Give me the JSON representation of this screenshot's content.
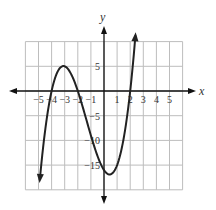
{
  "chart_data": {
    "type": "line",
    "title": "",
    "xlabel": "x",
    "ylabel": "y",
    "function": "f(x) = (x+4)(x+2)(x-2)",
    "x_ticks": [
      -5,
      -4,
      -3,
      -2,
      -1,
      1,
      2,
      3,
      4,
      5
    ],
    "y_ticks": [
      5,
      -5,
      -10,
      -15
    ],
    "x_tick_labels": [
      "−5",
      "−4",
      "−3",
      "−2",
      "−1",
      "1",
      "2",
      "3",
      "4",
      "5"
    ],
    "y_tick_labels": [
      "5",
      "−5",
      "−10",
      "−15"
    ],
    "xlim": [
      -6,
      6
    ],
    "ylim": [
      -20,
      10
    ],
    "grid": true,
    "grid_x_step": 1,
    "grid_y_step": 5,
    "roots": [
      -4,
      -2,
      2
    ],
    "local_max": {
      "x": -3.1,
      "y": 5.0
    },
    "local_min": {
      "x": 0.43,
      "y": -16.9
    },
    "y_intercept": -16,
    "x_range_plotted": [
      -4.9,
      2.4
    ],
    "series": [
      {
        "name": "f(x)",
        "x": [
          -4.9,
          -4.5,
          -4,
          -3.5,
          -3,
          -2.5,
          -2,
          -1.5,
          -1,
          -0.5,
          0,
          0.5,
          1,
          1.5,
          2,
          2.4
        ],
        "y": [
          -18.0,
          -7.9,
          0,
          3.9,
          5.0,
          3.9,
          0,
          -5.1,
          -9.0,
          -14.6,
          -16.0,
          -16.9,
          -15.0,
          -10.9,
          0,
          9.2
        ]
      }
    ],
    "legend": []
  },
  "labels": {
    "x_axis": "x",
    "y_axis": "y"
  },
  "colors": {
    "curve": "#222222",
    "grid": "#bdbdbd",
    "axis": "#111111"
  }
}
